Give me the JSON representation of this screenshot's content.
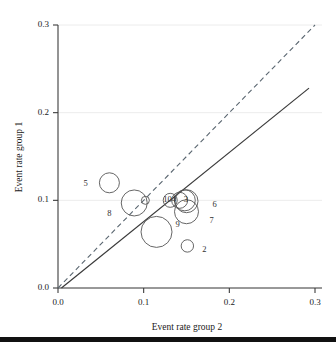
{
  "figure": {
    "name": "bubble-scatter-event-rates",
    "background": "#ffffff",
    "bottom_bar_color": "#111111"
  },
  "chart_data": {
    "type": "scatter",
    "title": "",
    "xlabel": "Event rate group 2",
    "ylabel": "Event rate group 1",
    "xlim": [
      0.0,
      0.3
    ],
    "ylim": [
      0.0,
      0.3
    ],
    "xticks": [
      "0.0",
      "0.1",
      "0.2",
      "0.3"
    ],
    "xtick_values": [
      0.0,
      0.1,
      0.2,
      0.3
    ],
    "yticks": [
      "0.0",
      "0.1",
      "0.2",
      "0.3"
    ],
    "ytick_values": [
      0.0,
      0.1,
      0.2,
      0.3
    ],
    "grid": "horizontal-light",
    "legend": "none",
    "marker_style": "open-circle",
    "marker_edge_color": "#555555",
    "marker_fill": "none",
    "size_encodes": "study weight",
    "points": [
      {
        "label": "2",
        "x": 0.151,
        "y": 0.048,
        "r": 6.2,
        "label_dx": 20,
        "label_dy": 4
      },
      {
        "label": "3",
        "x": 0.148,
        "y": 0.1,
        "r": 10.5,
        "label_dx": 4,
        "label_dy": 0
      },
      {
        "label": "4",
        "x": 0.142,
        "y": 0.1,
        "r": 8.0,
        "label_dx": -3,
        "label_dy": 0
      },
      {
        "label": "5",
        "x": 0.06,
        "y": 0.12,
        "r": 10.0,
        "label_dx": -21,
        "label_dy": 1
      },
      {
        "label": "6",
        "x": 0.15,
        "y": 0.099,
        "r": 11.5,
        "label_dx": 31,
        "label_dy": 4
      },
      {
        "label": "7",
        "x": 0.15,
        "y": 0.087,
        "r": 12.0,
        "label_dx": 28,
        "label_dy": 9
      },
      {
        "label": "8",
        "x": 0.089,
        "y": 0.097,
        "r": 13.0,
        "label_dx": -22,
        "label_dy": 11
      },
      {
        "label": "9",
        "x": 0.115,
        "y": 0.064,
        "r": 15.5,
        "label_dx": 24,
        "label_dy": -7
      },
      {
        "label": "10",
        "x": 0.131,
        "y": 0.1,
        "r": 7.0,
        "label_dx": -2,
        "label_dy": 0
      },
      {
        "label": "",
        "x": 0.102,
        "y": 0.1,
        "r": 4.0,
        "label_dx": 0,
        "label_dy": 0
      }
    ],
    "lines": [
      {
        "name": "line-of-equality",
        "style": "dashed",
        "color": "#5a6670",
        "x0": 0.0,
        "y0": 0.0,
        "x1": 0.3,
        "y1": 0.3
      },
      {
        "name": "regression-line",
        "style": "solid",
        "color": "#3a3a3a",
        "x0": 0.004,
        "y0": 0.0,
        "x1": 0.293,
        "y1": 0.228
      }
    ]
  }
}
